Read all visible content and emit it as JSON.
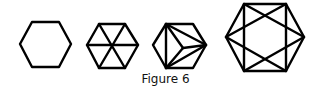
{
  "figure": {
    "caption": "Figure 6",
    "stroke_color": "#000000",
    "items": [
      {
        "name": "plain-hexagon"
      },
      {
        "name": "hexagon-with-diagonals"
      },
      {
        "name": "hexagon-cube-triangulated"
      },
      {
        "name": "hexagon-star-rectangle"
      }
    ]
  }
}
